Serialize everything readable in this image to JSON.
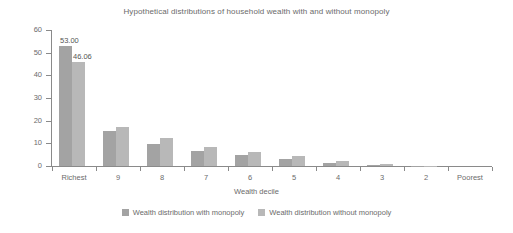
{
  "chart_data": {
    "type": "bar",
    "title": "Hypothetical distributions of household wealth with and without monopoly",
    "xlabel": "Wealth decile",
    "ylabel": "Percent",
    "categories": [
      "Richest",
      "9",
      "8",
      "7",
      "6",
      "5",
      "4",
      "3",
      "2",
      "Poorest"
    ],
    "series": [
      {
        "name": "Wealth distribution with monopoly",
        "color": "#a3a3a3",
        "values": [
          53.0,
          15.4,
          9.8,
          6.8,
          4.7,
          3.0,
          1.4,
          0.5,
          0.1,
          0.0
        ],
        "labels": [
          "53.00",
          "",
          "",
          "",
          "",
          "",
          "",
          "",
          "",
          ""
        ]
      },
      {
        "name": "Wealth distribution without monopoly",
        "color": "#b8b8b8",
        "values": [
          46.06,
          17.0,
          12.3,
          8.3,
          6.3,
          4.3,
          2.3,
          0.9,
          0.2,
          0.0
        ],
        "labels": [
          "46.06",
          "",
          "",
          "",
          "",
          "",
          "",
          "",
          "",
          ""
        ]
      }
    ],
    "ylim": [
      0,
      60
    ],
    "yticks": [
      "0",
      "10",
      "20",
      "30",
      "40",
      "50",
      "60"
    ],
    "grid": false,
    "legend_position": "bottom"
  },
  "legend": {
    "items": [
      {
        "label": "Wealth distribution with monopoly"
      },
      {
        "label": "Wealth distribution without monopoly"
      }
    ]
  }
}
